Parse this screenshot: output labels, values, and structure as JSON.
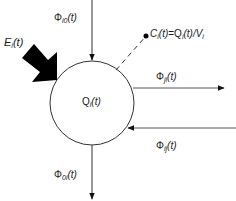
{
  "diagram": {
    "type": "compartment-flux",
    "compartment": {
      "label_symbol": "Q",
      "label_sub": "i",
      "label_arg": "(t)"
    },
    "flows": {
      "inflow_top": {
        "symbol": "Φ",
        "sub": "i0",
        "arg": "(t)",
        "direction": "in"
      },
      "outflow_bottom": {
        "symbol": "Φ",
        "sub": "0i",
        "arg": "(t)",
        "direction": "out"
      },
      "outflow_right": {
        "symbol": "Φ",
        "sub": "ji",
        "arg": "(t)",
        "direction": "out"
      },
      "inflow_right": {
        "symbol": "Φ",
        "sub": "ij",
        "arg": "(t)",
        "direction": "in"
      }
    },
    "external_input": {
      "symbol": "E",
      "sub": "i",
      "arg": "(t)"
    },
    "concentration": {
      "lhs_symbol": "C",
      "lhs_sub": "i",
      "lhs_arg": "(t)",
      "equals": "=",
      "rhs_symbol": "Q",
      "rhs_sub": "i",
      "rhs_arg": "(t)/V",
      "rhs_tail_sub": "i"
    },
    "colors": {
      "line": "#222222",
      "fill": "#000000",
      "background": "#ffffff"
    }
  }
}
